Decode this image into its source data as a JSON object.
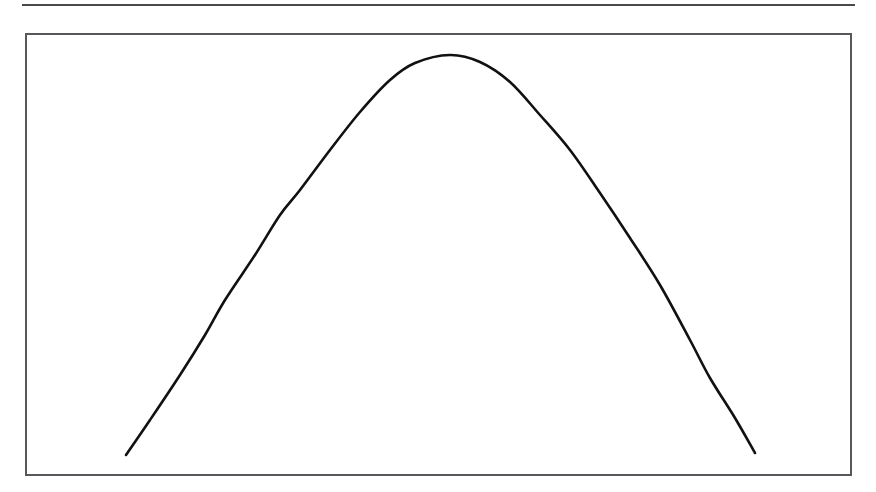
{
  "figure": {
    "kind": "bell-curve-figure",
    "background_color": "#ffffff",
    "header_rule": {
      "name": "horizontal-rule",
      "color": "#4a4a4a",
      "x": 22,
      "y": 4,
      "width": 833,
      "thickness": 2
    },
    "frame": {
      "name": "plot-frame",
      "border_color": "#58585c",
      "border_width": 2,
      "x": 25,
      "y": 33,
      "width": 827,
      "height": 443
    }
  },
  "chart_data": {
    "type": "line",
    "title": "",
    "subtitle": "",
    "xlabel": "",
    "ylabel": "",
    "legend": [],
    "annotations": [],
    "grid": false,
    "axis_ticks_visible": false,
    "tick_labels_x": [],
    "tick_labels_y": [],
    "xlim": [
      126,
      755
    ],
    "ylim": [
      55,
      455
    ],
    "series": [
      {
        "name": "bell-curve",
        "color": "#111111",
        "line_width": 2.6,
        "x": [
          126,
          150,
          180,
          205,
          225,
          255,
          280,
          300,
          330,
          360,
          390,
          415,
          450,
          480,
          510,
          540,
          570,
          600,
          630,
          660,
          690,
          710,
          735,
          755
        ],
        "y": [
          455,
          420,
          375,
          335,
          300,
          255,
          215,
          190,
          150,
          112,
          80,
          63,
          55,
          62,
          82,
          115,
          150,
          193,
          238,
          285,
          340,
          378,
          418,
          453
        ]
      }
    ],
    "peak": {
      "x": 450,
      "y": 55
    },
    "left_endpoint": {
      "x": 126,
      "y": 455
    },
    "right_endpoint": {
      "x": 755,
      "y": 453
    }
  }
}
